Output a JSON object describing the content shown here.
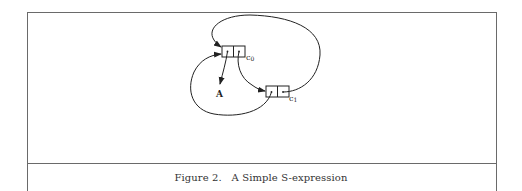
{
  "figure": {
    "caption": "Figure 2.   A Simple S-expression",
    "nodes": {
      "c0": {
        "label_main": "c",
        "label_sub": "0"
      },
      "c1": {
        "label_main": "c",
        "label_sub": "1"
      },
      "atom": {
        "label": "A"
      }
    },
    "edges": [
      {
        "from": "c0.car",
        "to": "A"
      },
      {
        "from": "c0.cdr",
        "to": "c1"
      },
      {
        "from": "c1.cdr",
        "to": "c0"
      },
      {
        "from": "c1.car",
        "to": "c0"
      }
    ]
  }
}
